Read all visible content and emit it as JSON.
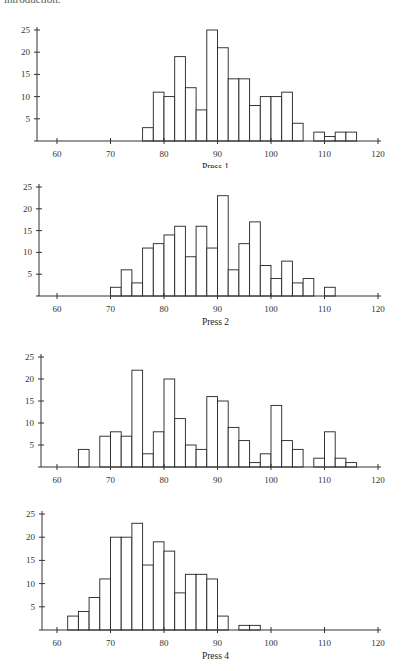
{
  "intro_text": "introduction.",
  "chart_data": [
    {
      "type": "bar",
      "title": "Press 1",
      "xlabel": "Press 1",
      "ylabel": "",
      "bin_width": 2,
      "bin_start": 76,
      "values": [
        3,
        11,
        10,
        19,
        12,
        7,
        25,
        21,
        14,
        14,
        8,
        10,
        10,
        11,
        4,
        0,
        2,
        1,
        2,
        2
      ],
      "xlim": [
        56,
        120
      ],
      "ylim": [
        0,
        25
      ],
      "xticks": [
        60,
        70,
        80,
        90,
        100,
        110,
        120
      ],
      "yticks": [
        5,
        10,
        15,
        20,
        25
      ],
      "grid": false
    },
    {
      "type": "bar",
      "title": "Press 2",
      "xlabel": "Press 2",
      "ylabel": "",
      "bin_width": 2,
      "bin_start": 70,
      "values": [
        2,
        6,
        3,
        11,
        12,
        14,
        16,
        9,
        16,
        11,
        23,
        6,
        12,
        17,
        7,
        4,
        8,
        3,
        4,
        0,
        2
      ],
      "xlim": [
        56,
        120
      ],
      "ylim": [
        0,
        25
      ],
      "xticks": [
        60,
        70,
        80,
        90,
        100,
        110,
        120
      ],
      "yticks": [
        5,
        10,
        15,
        20,
        25
      ],
      "grid": false
    },
    {
      "type": "bar",
      "title": "Press 3",
      "xlabel": "Press 3",
      "ylabel": "",
      "bin_width": 2,
      "bin_start": 64,
      "values": [
        4,
        0,
        7,
        8,
        7,
        22,
        3,
        8,
        20,
        11,
        5,
        4,
        16,
        15,
        9,
        6,
        1,
        3,
        14,
        6,
        4,
        0,
        2,
        8,
        2,
        1
      ],
      "xlim": [
        56,
        120
      ],
      "ylim": [
        0,
        25
      ],
      "xticks": [
        60,
        70,
        80,
        90,
        100,
        110,
        120
      ],
      "yticks": [
        5,
        10,
        15,
        20,
        25
      ],
      "grid": false
    },
    {
      "type": "bar",
      "title": "Press 4",
      "xlabel": "Press 4",
      "ylabel": "",
      "bin_width": 2,
      "bin_start": 62,
      "values": [
        3,
        4,
        7,
        11,
        20,
        20,
        23,
        14,
        19,
        17,
        8,
        12,
        12,
        11,
        3,
        0,
        1,
        1
      ],
      "xlim": [
        56,
        120
      ],
      "ylim": [
        0,
        25
      ],
      "xticks": [
        60,
        70,
        80,
        90,
        100,
        110,
        120
      ],
      "yticks": [
        5,
        10,
        15,
        20,
        25
      ],
      "grid": false
    }
  ]
}
